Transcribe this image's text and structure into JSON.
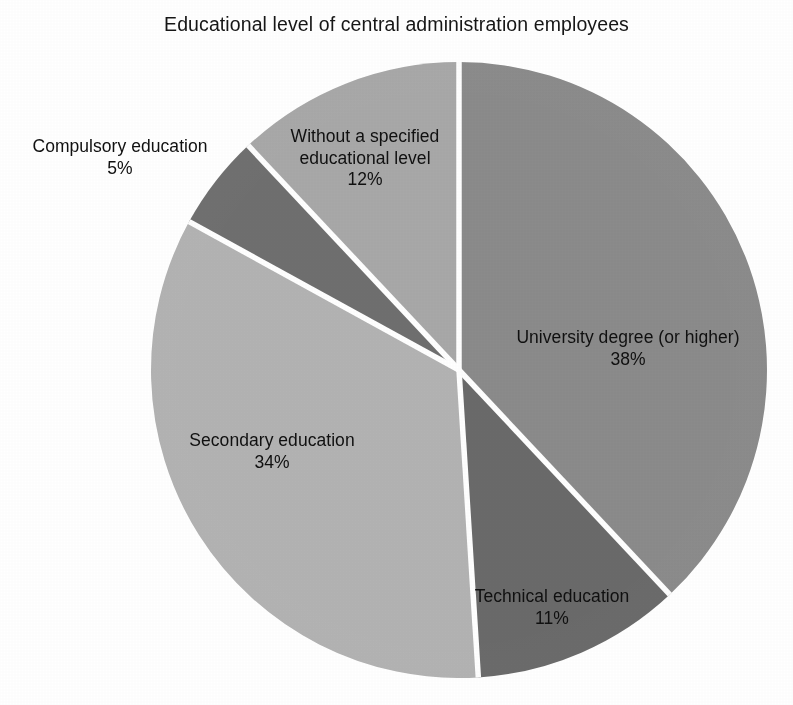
{
  "chart_data": {
    "type": "pie",
    "title": "Educational level of central administration employees",
    "unit": "%",
    "categories": [
      "University degree (or higher)",
      "Technical education",
      "Secondary education",
      "Compulsory education",
      "Without a specified educational level"
    ],
    "values": [
      38,
      11,
      34,
      5,
      12
    ],
    "labels": [
      "University degree (or higher)",
      "Technical education",
      "Secondary education",
      "Compulsory education",
      "Without a specified educational level"
    ],
    "value_labels": [
      "38%",
      "11%",
      "34%",
      "5%",
      "12%"
    ],
    "colors": [
      "#8b8b8b",
      "#6a6a6a",
      "#b3b3b3",
      "#6f6f6f",
      "#a8a8a8"
    ],
    "start_angle_deg": 0,
    "direction": "clockwise",
    "legend": "none",
    "label_position": "inside-and-outside",
    "separator_color": "#ffffff",
    "background": "#ffffff",
    "xlabel": "",
    "ylabel": "",
    "grid": false
  },
  "title": {
    "text": "Educational level of central administration employees"
  },
  "slices": {
    "university": {
      "name": "University degree (or higher)",
      "percent": "38%",
      "value": 38,
      "color": "#8b8b8b"
    },
    "technical": {
      "name": "Technical education",
      "percent": "11%",
      "value": 11,
      "color": "#6a6a6a"
    },
    "secondary": {
      "name": "Secondary education",
      "percent": "34%",
      "value": 34,
      "color": "#b3b3b3"
    },
    "compulsory": {
      "name": "Compulsory education",
      "percent": "5%",
      "value": 5,
      "color": "#6f6f6f"
    },
    "unspecified": {
      "name_line1": "Without a specified",
      "name_line2": "educational level",
      "name": "Without a specified educational level",
      "percent": "12%",
      "value": 12,
      "color": "#a8a8a8"
    }
  }
}
